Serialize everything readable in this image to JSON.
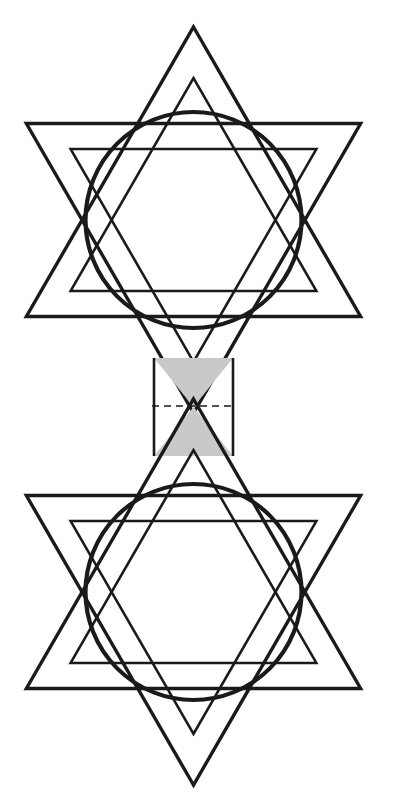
{
  "figure": {
    "background_color": "#ffffff",
    "stroke_color": "#1a1a1a",
    "shade_color": "#c9c9c9",
    "canvas": {
      "width": 399,
      "height": 809
    },
    "labels": {
      "top_star": "top-hexagram-rosette",
      "bottom_star": "bottom-hexagram-rosette",
      "connector": "shaded-hourglass-connector",
      "axis": "dashed-center-axis"
    }
  },
  "geometry": {
    "stroke_width": 3.4,
    "inner_stroke_width": 2.6,
    "circle_stroke_width": 4.2,
    "dash_pattern": "7 5",
    "dash_stroke_width": 1.6,
    "top_star": {
      "center_x": 193.5,
      "center_y": 220,
      "outer_radius": 193,
      "inner_scale": 0.735,
      "circle_radius": 108,
      "up_apex_y": 31,
      "left_tip_x": 26,
      "right_tip_x": 361,
      "crossbar_y": 122
    },
    "bottom_star": {
      "center_x": 193.5,
      "center_y": 592,
      "outer_radius": 193,
      "inner_scale": 0.735,
      "circle_radius": 108,
      "down_apex_y": 781,
      "left_tip_x": 26,
      "right_tip_x": 361,
      "crossbar_y": 690
    },
    "connector": {
      "left_x": 154,
      "right_x": 233,
      "top_y": 358,
      "bottom_y": 456,
      "axis_y": 406,
      "axis_left_x": 152,
      "axis_right_x": 236
    }
  },
  "chart_data": {
    "type": "diagram",
    "shapes": [
      {
        "name": "top-up-triangle",
        "kind": "triangle",
        "orientation": "up",
        "center": [
          193.5,
          220
        ],
        "radius": 193,
        "fill": "none",
        "stroke": "#1a1a1a"
      },
      {
        "name": "top-down-triangle",
        "kind": "triangle",
        "orientation": "down",
        "center": [
          193.5,
          220
        ],
        "radius": 193,
        "fill": "none",
        "stroke": "#1a1a1a"
      },
      {
        "name": "top-inner-up-triangle",
        "kind": "triangle",
        "orientation": "up",
        "center": [
          193.5,
          220
        ],
        "radius": 141.9,
        "fill": "none",
        "stroke": "#1a1a1a"
      },
      {
        "name": "top-inner-down-triangle",
        "kind": "triangle",
        "orientation": "down",
        "center": [
          193.5,
          220
        ],
        "radius": 141.9,
        "fill": "none",
        "stroke": "#1a1a1a"
      },
      {
        "name": "top-circle",
        "kind": "circle",
        "center": [
          193.5,
          220
        ],
        "radius": 108,
        "fill": "none",
        "stroke": "#1a1a1a"
      },
      {
        "name": "bottom-up-triangle",
        "kind": "triangle",
        "orientation": "up",
        "center": [
          193.5,
          592
        ],
        "radius": 193,
        "fill": "none",
        "stroke": "#1a1a1a"
      },
      {
        "name": "bottom-down-triangle",
        "kind": "triangle",
        "orientation": "down",
        "center": [
          193.5,
          592
        ],
        "radius": 193,
        "fill": "none",
        "stroke": "#1a1a1a"
      },
      {
        "name": "bottom-inner-up-triangle",
        "kind": "triangle",
        "orientation": "up",
        "center": [
          193.5,
          592
        ],
        "radius": 141.9,
        "fill": "none",
        "stroke": "#1a1a1a"
      },
      {
        "name": "bottom-inner-down-triangle",
        "kind": "triangle",
        "orientation": "down",
        "center": [
          193.5,
          592
        ],
        "radius": 141.9,
        "fill": "none",
        "stroke": "#1a1a1a"
      },
      {
        "name": "bottom-circle",
        "kind": "circle",
        "center": [
          193.5,
          592
        ],
        "radius": 108,
        "fill": "none",
        "stroke": "#1a1a1a"
      },
      {
        "name": "connector-band",
        "kind": "rectangle",
        "x": 154,
        "y": 358,
        "width": 79,
        "height": 98,
        "fill": "#c9c9c9",
        "stroke": "none"
      },
      {
        "name": "connector-diagonal-a",
        "kind": "line",
        "from": [
          154,
          358
        ],
        "to": [
          233,
          456
        ],
        "stroke": "#1a1a1a"
      },
      {
        "name": "connector-diagonal-b",
        "kind": "line",
        "from": [
          233,
          358
        ],
        "to": [
          154,
          456
        ],
        "stroke": "#1a1a1a"
      },
      {
        "name": "center-axis",
        "kind": "dashed-line",
        "from": [
          152,
          406
        ],
        "to": [
          236,
          406
        ],
        "stroke": "#1a1a1a"
      }
    ]
  }
}
